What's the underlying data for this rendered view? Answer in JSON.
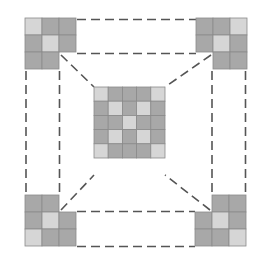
{
  "diagram": {
    "colors": {
      "dark_cell": "#a8a8a8",
      "light_cell": "#d6d6d6",
      "grid_line": "#8a8a8a",
      "dash": "#555555",
      "background": "#ffffff"
    },
    "cell_size": 17,
    "center_grid": {
      "x": 94,
      "y": 87,
      "rows": 5,
      "cols": 5,
      "cell_size": 14.2,
      "light_cells": [
        [
          0,
          0
        ],
        [
          0,
          4
        ],
        [
          1,
          1
        ],
        [
          1,
          3
        ],
        [
          2,
          2
        ],
        [
          3,
          1
        ],
        [
          3,
          3
        ],
        [
          4,
          0
        ],
        [
          4,
          4
        ]
      ]
    },
    "corners": [
      {
        "name": "top-left",
        "x": 25,
        "y": 18,
        "cells": [
          [
            0,
            0,
            "light"
          ],
          [
            0,
            1,
            "dark"
          ],
          [
            0,
            2,
            "dark"
          ],
          [
            1,
            0,
            "dark"
          ],
          [
            1,
            1,
            "light"
          ],
          [
            1,
            2,
            "dark"
          ],
          [
            2,
            0,
            "dark"
          ],
          [
            2,
            1,
            "dark"
          ]
        ]
      },
      {
        "name": "top-right",
        "x": 196,
        "y": 18,
        "cells": [
          [
            0,
            0,
            "dark"
          ],
          [
            0,
            1,
            "dark"
          ],
          [
            0,
            2,
            "light"
          ],
          [
            1,
            0,
            "dark"
          ],
          [
            1,
            1,
            "light"
          ],
          [
            1,
            2,
            "dark"
          ],
          [
            2,
            1,
            "dark"
          ],
          [
            2,
            2,
            "dark"
          ]
        ]
      },
      {
        "name": "bottom-left",
        "x": 25,
        "y": 195,
        "cells": [
          [
            0,
            0,
            "dark"
          ],
          [
            0,
            1,
            "dark"
          ],
          [
            1,
            0,
            "dark"
          ],
          [
            1,
            1,
            "light"
          ],
          [
            1,
            2,
            "dark"
          ],
          [
            2,
            0,
            "light"
          ],
          [
            2,
            1,
            "dark"
          ],
          [
            2,
            2,
            "dark"
          ]
        ]
      },
      {
        "name": "bottom-right",
        "x": 195,
        "y": 195,
        "cells": [
          [
            0,
            1,
            "dark"
          ],
          [
            0,
            2,
            "dark"
          ],
          [
            1,
            0,
            "dark"
          ],
          [
            1,
            1,
            "light"
          ],
          [
            1,
            2,
            "dark"
          ],
          [
            2,
            0,
            "dark"
          ],
          [
            2,
            1,
            "dark"
          ],
          [
            2,
            2,
            "light"
          ]
        ]
      }
    ]
  }
}
